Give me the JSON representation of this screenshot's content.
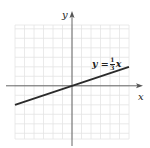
{
  "chart_data": {
    "type": "line",
    "title": "",
    "xlabel": "x",
    "ylabel": "y",
    "xlim": [
      -6,
      6
    ],
    "ylim": [
      -5.6,
      6.4
    ],
    "grid": true,
    "grid_step": 1,
    "series": [
      {
        "name": "y = 1/3 x",
        "equation": "y = (1/3)x",
        "slope": 0.3333,
        "intercept": 0,
        "x": [
          -6,
          6
        ],
        "y": [
          -2,
          2
        ]
      }
    ],
    "annotations": [
      {
        "text": "y = 1/3 x",
        "x": 2.2,
        "y": 2.7
      }
    ],
    "legend": "none"
  },
  "labels": {
    "x_axis": "x",
    "y_axis": "y",
    "equation_lhs": "y =",
    "fraction_numerator": "1",
    "fraction_denominator": "3",
    "equation_rhs": "x"
  },
  "colors": {
    "line": "#2a2a2a",
    "axis": "#555555",
    "grid": "#e4e4e4",
    "background": "#ffffff"
  }
}
